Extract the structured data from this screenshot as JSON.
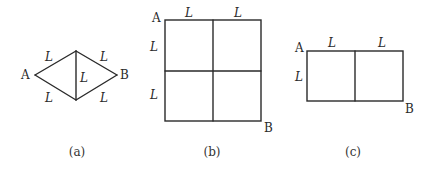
{
  "figures": [
    {
      "id": "a",
      "caption": "(a)",
      "shape": "rhombus with vertical diagonal",
      "vertex_labels": {
        "start": "A",
        "end": "B"
      },
      "edge_labels": {
        "upper_left": "L",
        "upper_right": "L",
        "lower_left": "L",
        "lower_right": "L",
        "middle": "L"
      }
    },
    {
      "id": "b",
      "caption": "(b)",
      "shape": "2x2 grid of squares",
      "vertex_labels": {
        "start": "A",
        "end": "B"
      },
      "edge_labels": {
        "top_left": "L",
        "top_right": "L",
        "left_upper": "L",
        "left_lower": "L"
      }
    },
    {
      "id": "c",
      "caption": "(c)",
      "shape": "1x2 grid of squares",
      "vertex_labels": {
        "start": "A",
        "end": "B"
      },
      "edge_labels": {
        "top_left": "L",
        "top_right": "L",
        "left": "L"
      }
    }
  ],
  "colors": {
    "line": "#2a2a2a",
    "text": "#2a2a2a",
    "background": "#ffffff"
  }
}
